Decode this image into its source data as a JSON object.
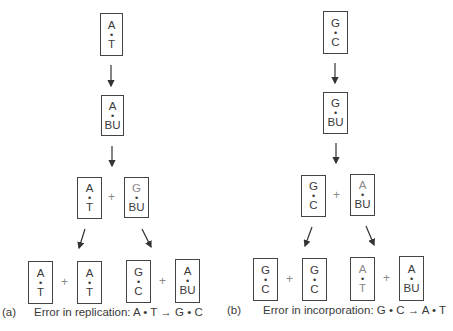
{
  "panel_a": {
    "label": "(a)",
    "caption": "Error in replication: A • T → G • C",
    "top": {
      "top": "A",
      "dot": "•",
      "bottom": "T"
    },
    "second": {
      "top": "A",
      "dot": "•",
      "bottom": "BU"
    },
    "level3": [
      {
        "top": "A",
        "dot": "•",
        "bottom": "T"
      },
      {
        "top": "G",
        "dot": "•",
        "bottom": "BU"
      }
    ],
    "level4": [
      {
        "top": "A",
        "dot": "•",
        "bottom": "T"
      },
      {
        "top": "A",
        "dot": "•",
        "bottom": "T"
      },
      {
        "top": "G",
        "dot": "•",
        "bottom": "C"
      },
      {
        "top": "A",
        "dot": "•",
        "bottom": "BU"
      }
    ],
    "plus": "+"
  },
  "panel_b": {
    "label": "(b)",
    "caption": "Error in incorporation: G • C → A • T",
    "top": {
      "top": "G",
      "dot": "•",
      "bottom": "C"
    },
    "second": {
      "top": "G",
      "dot": "•",
      "bottom": "BU"
    },
    "level3": [
      {
        "top": "G",
        "dot": "•",
        "bottom": "C"
      },
      {
        "top": "A",
        "dot": "•",
        "bottom": "BU"
      }
    ],
    "level4": [
      {
        "top": "G",
        "dot": "•",
        "bottom": "C"
      },
      {
        "top": "G",
        "dot": "•",
        "bottom": "C"
      },
      {
        "top": "A",
        "dot": "•",
        "bottom": "T"
      },
      {
        "top": "A",
        "dot": "•",
        "bottom": "BU"
      }
    ],
    "plus": "+"
  },
  "colors": {
    "line": "#444444",
    "text": "#3a3a3a",
    "faint": "#8a8a8a"
  }
}
